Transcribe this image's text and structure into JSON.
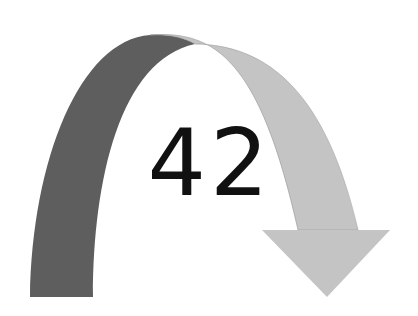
{
  "diagram": {
    "label": "42",
    "colors": {
      "dark_band": "#5e5e5e",
      "light_band": "#c4c4c4",
      "background": "#ffffff",
      "text": "#111111"
    }
  }
}
